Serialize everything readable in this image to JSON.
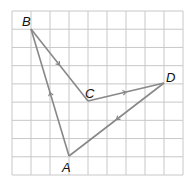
{
  "diagram": {
    "grid": {
      "cols": 9,
      "rows": 9,
      "x0": 12,
      "y0": 11,
      "x1": 183,
      "y1": 175,
      "color": "#c8c8c8"
    },
    "line_color": "#888888",
    "points": {
      "A": {
        "label": "A",
        "x": 69,
        "y": 156,
        "lx": 62,
        "ly": 172
      },
      "B": {
        "label": "B",
        "x": 31,
        "y": 29,
        "lx": 22,
        "ly": 26
      },
      "C": {
        "label": "C",
        "x": 88,
        "y": 101,
        "lx": 85,
        "ly": 98
      },
      "D": {
        "label": "D",
        "x": 164,
        "y": 83,
        "lx": 166,
        "ly": 82
      }
    },
    "segments": [
      {
        "from": "A",
        "to": "B",
        "arrow": true
      },
      {
        "from": "B",
        "to": "C",
        "arrow": true
      },
      {
        "from": "C",
        "to": "D",
        "arrow": true
      },
      {
        "from": "D",
        "to": "A",
        "arrow": true
      }
    ]
  }
}
